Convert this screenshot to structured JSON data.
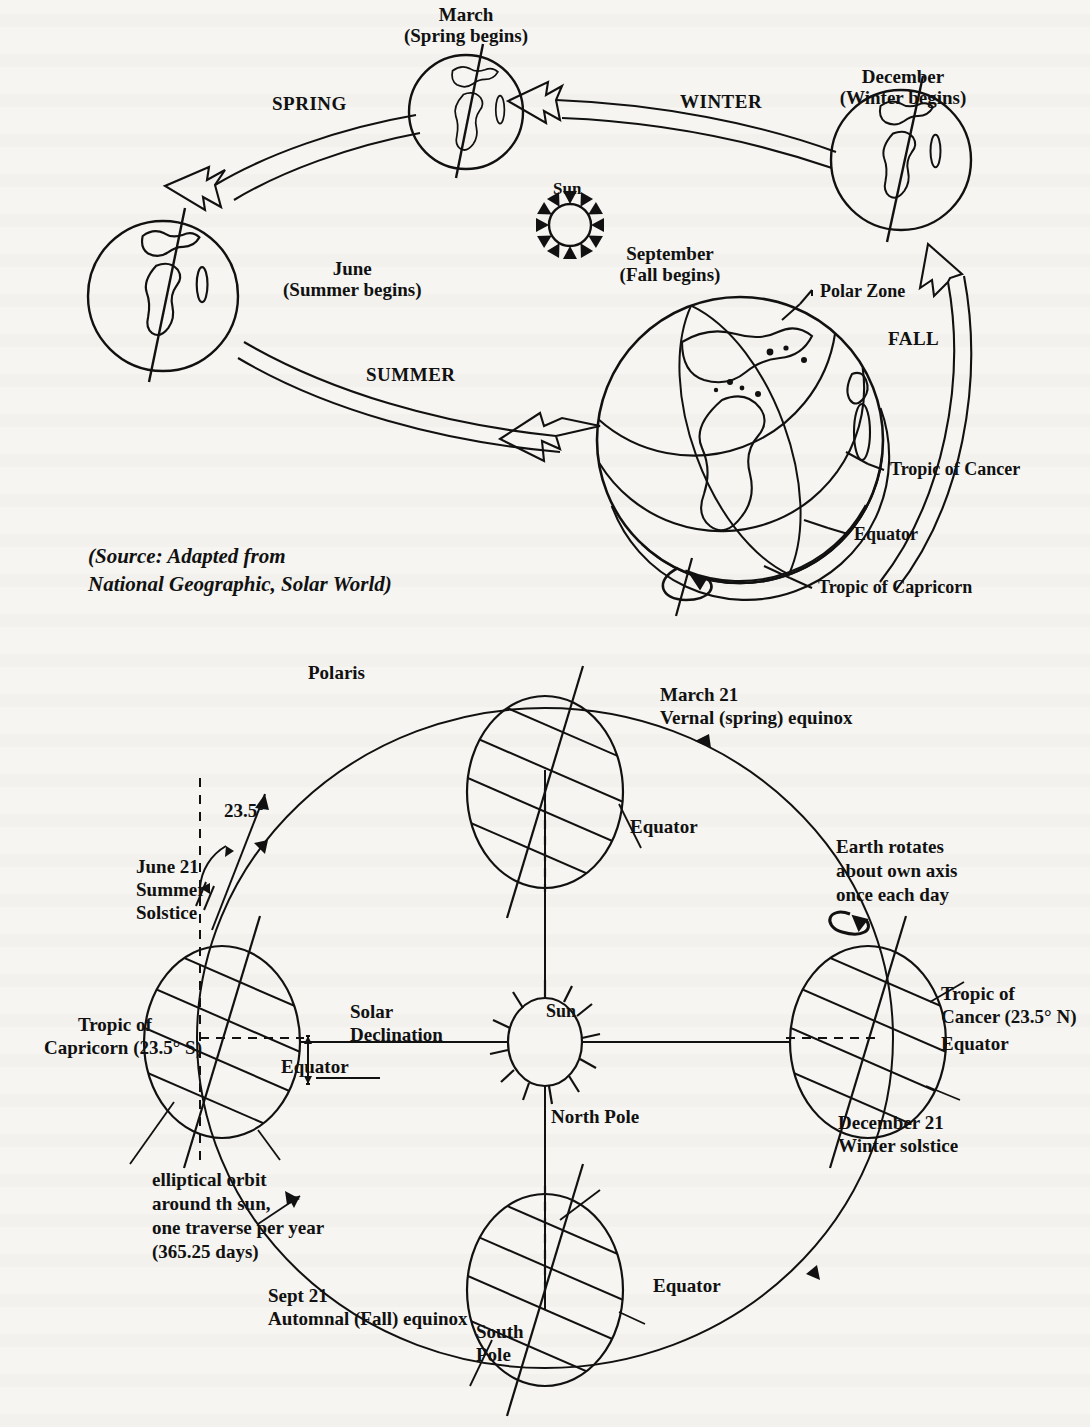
{
  "page": {
    "background": "#f6f5f1",
    "ink": "#111111"
  },
  "top_diagram": {
    "name": "Seasons orbit diagram",
    "sun_label": "Sun",
    "source_note_line1": "(Source: Adapted from",
    "source_note_line2": "National Geographic, Solar World)",
    "positions": [
      {
        "id": "march",
        "line1": "March",
        "line2": "(Spring begins)"
      },
      {
        "id": "june",
        "line1": "June",
        "line2": "(Summer begins)"
      },
      {
        "id": "september",
        "line1": "September",
        "line2": "(Fall begins)"
      },
      {
        "id": "december",
        "line1": "December",
        "line2": "(Winter begins)"
      }
    ],
    "seasons": [
      {
        "id": "spring",
        "label": "SPRING"
      },
      {
        "id": "summer",
        "label": "SUMMER"
      },
      {
        "id": "fall",
        "label": "FALL"
      },
      {
        "id": "winter",
        "label": "WINTER"
      }
    ],
    "globe_callouts": [
      {
        "id": "polar-zone",
        "label": "Polar Zone"
      },
      {
        "id": "tropic-of-cancer",
        "label": "Tropic of Cancer"
      },
      {
        "id": "equator",
        "label": "Equator"
      },
      {
        "id": "tropic-of-capricorn",
        "label": "Tropic of Capricorn"
      }
    ]
  },
  "bottom_diagram": {
    "name": "Earth orbit and axial tilt diagram",
    "sun_label": "Sun",
    "polaris_label": "Polaris",
    "tilt_angle": "23.5°",
    "rotation_note_line1": "Earth rotates",
    "rotation_note_line2": "about own axis",
    "rotation_note_line3": "once each day",
    "orbit_note_line1": "elliptical orbit",
    "orbit_note_line2": "around th sun,",
    "orbit_note_line3": "one traverse per year",
    "orbit_note_line4": "(365.25 days)",
    "solar_declination_line1": "Solar",
    "solar_declination_line2": "Declination",
    "north_pole_label": "North Pole",
    "south_pole_line1": "South",
    "south_pole_line2": "Pole",
    "stations": [
      {
        "id": "march-21",
        "line1": "March 21",
        "line2": "Vernal (spring) equinox"
      },
      {
        "id": "june-21",
        "line1": "June 21",
        "line2": "Summer",
        "line3": "Solstice"
      },
      {
        "id": "sept-21",
        "line1": "Sept 21",
        "line2": "Automnal (Fall) equinox"
      },
      {
        "id": "december-21",
        "line1": "December 21",
        "line2": "Winter solstice"
      }
    ],
    "latitude_labels": [
      {
        "id": "equator-march",
        "label": "Equator"
      },
      {
        "id": "equator-june",
        "label": "Equator"
      },
      {
        "id": "equator-sept",
        "label": "Equator"
      },
      {
        "id": "equator-december",
        "label": "Equator"
      },
      {
        "id": "tropic-capricorn-june-l1",
        "label": "Tropic of"
      },
      {
        "id": "tropic-capricorn-june-l2",
        "label": "Capricorn (23.5° S)"
      },
      {
        "id": "tropic-cancer-dec-l1",
        "label": "Tropic of"
      },
      {
        "id": "tropic-cancer-dec-l2",
        "label": "Cancer (23.5° N)"
      }
    ]
  }
}
